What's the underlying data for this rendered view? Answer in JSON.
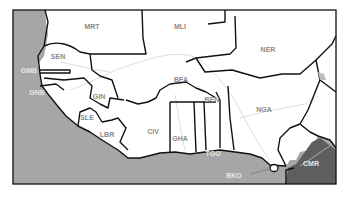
{
  "map": {
    "title": "West Africa",
    "colors": {
      "ocean": "#a6a6a6",
      "land": "#ffffff",
      "highlight_country": "#5e5e5e",
      "border": "#111111",
      "river": "#cfcfcf",
      "label": "#8a8a8a",
      "label_on_dark": "#e8e8e8"
    },
    "labels": {
      "MRT": "MRT",
      "MLI": "MLI",
      "NER": "NER",
      "SEN": "SEN",
      "GMB": "GMB",
      "GNB": "GNB",
      "GIN": "GIN",
      "SLE": "SLE",
      "LBR": "LBR",
      "CIV": "CIV",
      "BFA": "BFA",
      "GHA": "GHA",
      "TGO": "TGO",
      "BEN": "BEN",
      "NGA": "NGA",
      "CMR": "CMR",
      "BKO": "BKO"
    }
  }
}
